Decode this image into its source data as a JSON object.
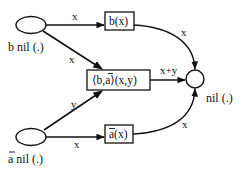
{
  "diagram": {
    "colors": {
      "stroke": "#111111",
      "background": "#ffffff"
    },
    "nodes": {
      "b_place": {
        "label": "b nil (.)",
        "label_prefix": "b",
        "label_rest": " nil (.)",
        "shape": "ellipse"
      },
      "abar_place": {
        "label": "ā nil (.)",
        "label_prefix": "a",
        "label_prefix_overline": true,
        "label_rest": " nil (.)",
        "shape": "ellipse"
      },
      "sink_place": {
        "label": "nil (.)",
        "shape": "circle"
      },
      "b_transition": {
        "label": "b(x)",
        "shape": "box"
      },
      "sync_transition": {
        "label": "⟨b,ā⟩(x,y)",
        "part_open": "⟨b,",
        "part_a": "a",
        "part_close": "⟩(x,y)",
        "shape": "box"
      },
      "abar_transition": {
        "label": "ā(x)",
        "part_a": "a",
        "part_rest": "(x)",
        "shape": "box"
      }
    },
    "edges": [
      {
        "from": "b_place",
        "to": "b_transition",
        "label": "x"
      },
      {
        "from": "b_place",
        "to": "sync_transition",
        "label": "x"
      },
      {
        "from": "abar_place",
        "to": "sync_transition",
        "label": "y"
      },
      {
        "from": "abar_place",
        "to": "abar_transition",
        "label": "x"
      },
      {
        "from": "b_transition",
        "to": "sink_place",
        "label": "x"
      },
      {
        "from": "sync_transition",
        "to": "sink_place",
        "label": "x+y"
      },
      {
        "from": "abar_transition",
        "to": "sink_place",
        "label": "x"
      }
    ]
  }
}
